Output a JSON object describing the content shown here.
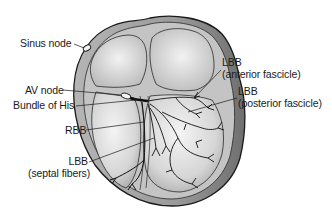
{
  "figure": {
    "type": "anatomical-diagram",
    "colors": {
      "background": "#ffffff",
      "outline": "#1a1a1a",
      "myocardium_outer": "#8a8a8a",
      "myocardium_light": "#c8c8c8",
      "chamber_fill": "#e6e6e6",
      "label_text": "#1a1a1a"
    }
  },
  "labels": {
    "sinus_node": "Sinus node",
    "av_node": "AV node",
    "bundle_of_his": "Bundle of His",
    "rbb": "RBB",
    "lbb_septal_line1": "LBB",
    "lbb_septal_line2": "(septal fibers)",
    "lbb_anterior_line1": "LBB",
    "lbb_anterior_line2": "(anterior fascicle)",
    "lbb_posterior_line1": "LBB",
    "lbb_posterior_line2": "(posterior fascicle)"
  }
}
